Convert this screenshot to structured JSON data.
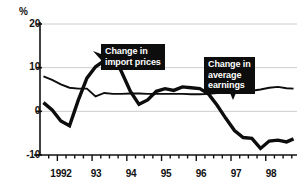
{
  "chart_data": {
    "type": "line",
    "title": "",
    "xlabel": "",
    "ylabel": "%",
    "ylim": [
      -10,
      20
    ],
    "yticks": [
      -10,
      0,
      10,
      20
    ],
    "ytick_labels": [
      "-10",
      "0",
      "10",
      "20"
    ],
    "xlim": [
      1991.5,
      1998.9
    ],
    "xtick_labels": [
      "1992",
      "93",
      "94",
      "95",
      "96",
      "97",
      "98"
    ],
    "xtick_values": [
      1992,
      1993,
      1994,
      1995,
      1996,
      1997,
      1998
    ],
    "minor_tick_interval": 0.25,
    "grid": true,
    "grid_color": "#cccccc",
    "legend": "annotations",
    "series": [
      {
        "name": "Change in import prices",
        "style": "thick",
        "color": "#0d0d0d",
        "width": 3.4,
        "x": [
          1991.6,
          1991.85,
          1992.1,
          1992.35,
          1992.6,
          1992.85,
          1993.1,
          1993.35,
          1993.6,
          1993.85,
          1994.1,
          1994.35,
          1994.6,
          1994.85,
          1995.1,
          1995.35,
          1995.6,
          1995.85,
          1996.1,
          1996.35,
          1996.6,
          1996.85,
          1997.1,
          1997.35,
          1997.6,
          1997.85,
          1998.1,
          1998.35,
          1998.6,
          1998.8
        ],
        "values": [
          2.0,
          0.3,
          -2.2,
          -3.3,
          2.5,
          7.6,
          10.2,
          11.6,
          13.0,
          9.0,
          4.6,
          1.6,
          2.6,
          4.6,
          5.2,
          4.8,
          5.6,
          5.4,
          5.2,
          4.0,
          1.4,
          -1.6,
          -4.4,
          -6.0,
          -6.2,
          -8.5,
          -6.8,
          -6.6,
          -7.0,
          -6.3
        ]
      },
      {
        "name": "Change in average earnings",
        "style": "thin",
        "color": "#0d0d0d",
        "width": 1.9,
        "x": [
          1991.6,
          1991.85,
          1992.1,
          1992.35,
          1992.6,
          1992.85,
          1993.1,
          1993.35,
          1993.6,
          1993.85,
          1994.1,
          1994.35,
          1994.6,
          1994.85,
          1995.1,
          1995.35,
          1995.6,
          1995.85,
          1996.1,
          1996.35,
          1996.6,
          1996.85,
          1997.1,
          1997.35,
          1997.6,
          1997.85,
          1998.1,
          1998.35,
          1998.6,
          1998.8
        ],
        "values": [
          8.0,
          7.2,
          6.2,
          5.4,
          5.2,
          5.2,
          3.4,
          4.2,
          4.0,
          4.0,
          4.1,
          4.1,
          4.0,
          4.0,
          4.0,
          4.0,
          4.0,
          3.9,
          3.9,
          4.0,
          4.2,
          4.4,
          4.6,
          4.5,
          4.7,
          5.0,
          5.4,
          5.6,
          5.3,
          5.2
        ]
      }
    ],
    "annotations": [
      {
        "name": "import-prices",
        "text": "Change in\nimport prices",
        "pointer": "left"
      },
      {
        "name": "average-earnings",
        "text": "Change in\naverage\nearnings",
        "pointer": "down"
      }
    ]
  },
  "axis": {
    "percent_sign": "%",
    "y_labels": [
      "20",
      "10",
      "0",
      "-10"
    ],
    "x_labels": [
      "1992",
      "93",
      "94",
      "95",
      "96",
      "97",
      "98"
    ]
  },
  "callouts": {
    "import_prices": "Change in\nimport prices",
    "average_earnings": "Change in\naverage\nearnings"
  }
}
